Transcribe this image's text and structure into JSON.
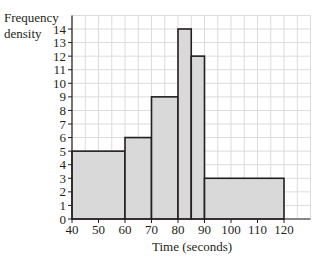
{
  "chart_data": {
    "type": "bar",
    "subtype": "histogram",
    "title": "",
    "xlabel": "Time (seconds)",
    "ylabel": "Frequency density",
    "ylabel_lines": [
      "Frequency",
      "density"
    ],
    "xlim": [
      40,
      130
    ],
    "ylim": [
      0,
      15
    ],
    "x_ticks": [
      40,
      50,
      60,
      70,
      80,
      90,
      100,
      110,
      120
    ],
    "y_ticks": [
      0,
      1,
      2,
      3,
      4,
      5,
      6,
      7,
      8,
      9,
      10,
      11,
      12,
      13,
      14
    ],
    "grid": true,
    "grid_minor_x_step": 5,
    "grid_minor_y_step": 1,
    "bins": [
      {
        "start": 40,
        "end": 60,
        "value": 5
      },
      {
        "start": 60,
        "end": 70,
        "value": 6
      },
      {
        "start": 70,
        "end": 80,
        "value": 9
      },
      {
        "start": 80,
        "end": 85,
        "value": 14
      },
      {
        "start": 85,
        "end": 90,
        "value": 12
      },
      {
        "start": 90,
        "end": 120,
        "value": 3
      }
    ],
    "categories": [
      "40-60",
      "60-70",
      "70-80",
      "80-85",
      "85-90",
      "90-120"
    ],
    "values": [
      5,
      6,
      9,
      14,
      12,
      3
    ],
    "colors": {
      "bar_fill": "#d9d9d9",
      "bar_edge": "#231f20",
      "grid": "#dcdcdc",
      "axis": "#231f20"
    }
  }
}
